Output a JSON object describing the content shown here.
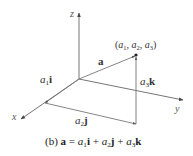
{
  "figure": {
    "axes": {
      "x_label": "x",
      "y_label": "y",
      "z_label": "z"
    },
    "point_label": {
      "open": "(",
      "a1": "a",
      "a1_sub": "1",
      "sep1": ", ",
      "a2": "a",
      "a2_sub": "2",
      "sep2": ", ",
      "a3": "a",
      "a3_sub": "3",
      "close": ")"
    },
    "vectors": {
      "a": "a",
      "a1i": {
        "coef": "a",
        "sub": "1",
        "unit": "i"
      },
      "a2j": {
        "coef": "a",
        "sub": "2",
        "unit": "j"
      },
      "a3k": {
        "coef": "a",
        "sub": "3",
        "unit": "k"
      }
    },
    "caption": {
      "prefix": "(b) ",
      "lhs": "a",
      "eq": " = ",
      "t1_coef": "a",
      "t1_sub": "1",
      "t1_unit": "i",
      "plus1": " + ",
      "t2_coef": "a",
      "t2_sub": "2",
      "t2_unit": "j",
      "plus2": " + ",
      "t3_coef": "a",
      "t3_sub": "3",
      "t3_unit": "k"
    },
    "colors": {
      "line": "#555555",
      "text": "#333333"
    }
  }
}
